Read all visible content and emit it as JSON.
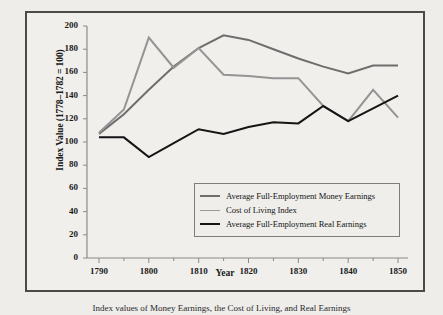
{
  "chart_data": {
    "type": "line",
    "title": "",
    "xlabel": "Year",
    "ylabel": "Index Value (1778–1782 = 100)",
    "xlim": [
      1788,
      1852
    ],
    "ylim": [
      0,
      200
    ],
    "ytick_labels": [
      "200",
      "180",
      "160",
      "140",
      "120",
      "100",
      "80",
      "60",
      "40",
      "20",
      "0"
    ],
    "ytick_values": [
      200,
      180,
      160,
      140,
      120,
      100,
      80,
      60,
      40,
      20,
      0
    ],
    "xtick_labels": [
      "1790",
      "1800",
      "1810",
      "1820",
      "1830",
      "1840",
      "1850"
    ],
    "xtick_values": [
      1790,
      1800,
      1810,
      1820,
      1830,
      1840,
      1850
    ],
    "grid": false,
    "legend_position": "lower-right",
    "series": [
      {
        "name": "Average Full-Employment Money Earnings",
        "color": "#6e6e6e",
        "width": 2.0,
        "x": [
          1790,
          1795,
          1800,
          1805,
          1810,
          1815,
          1820,
          1825,
          1830,
          1835,
          1840,
          1845,
          1850
        ],
        "values": [
          107,
          124,
          145,
          165,
          181,
          192,
          188,
          180,
          172,
          165,
          159,
          166,
          166
        ]
      },
      {
        "name": "Cost of Living Index",
        "color": "#949494",
        "width": 2.0,
        "x": [
          1790,
          1795,
          1800,
          1805,
          1810,
          1815,
          1820,
          1825,
          1830,
          1835,
          1840,
          1845,
          1850
        ],
        "values": [
          108,
          128,
          190,
          164,
          181,
          158,
          157,
          155,
          155,
          131,
          118,
          145,
          121
        ]
      },
      {
        "name": "Average Full-Employment Real Earnings",
        "color": "#151515",
        "width": 2.0,
        "x": [
          1790,
          1795,
          1800,
          1805,
          1810,
          1815,
          1820,
          1825,
          1830,
          1835,
          1840,
          1845,
          1850
        ],
        "values": [
          104,
          104,
          87,
          99,
          111,
          107,
          113,
          117,
          116,
          131,
          118,
          129,
          140
        ]
      }
    ]
  },
  "legend": {
    "items": [
      {
        "label": "Average Full-Employment Money Earnings",
        "color": "#6e6e6e",
        "width": "2.2px"
      },
      {
        "label": "Cost of Living Index",
        "color": "#9a9a9a",
        "width": "1.8px"
      },
      {
        "label": "Average Full-Employment Real Earnings",
        "color": "#151515",
        "width": "2.4px"
      }
    ]
  },
  "caption": {
    "text": "Index values of Money Earnings, the Cost of Living, and Real Earnings"
  }
}
